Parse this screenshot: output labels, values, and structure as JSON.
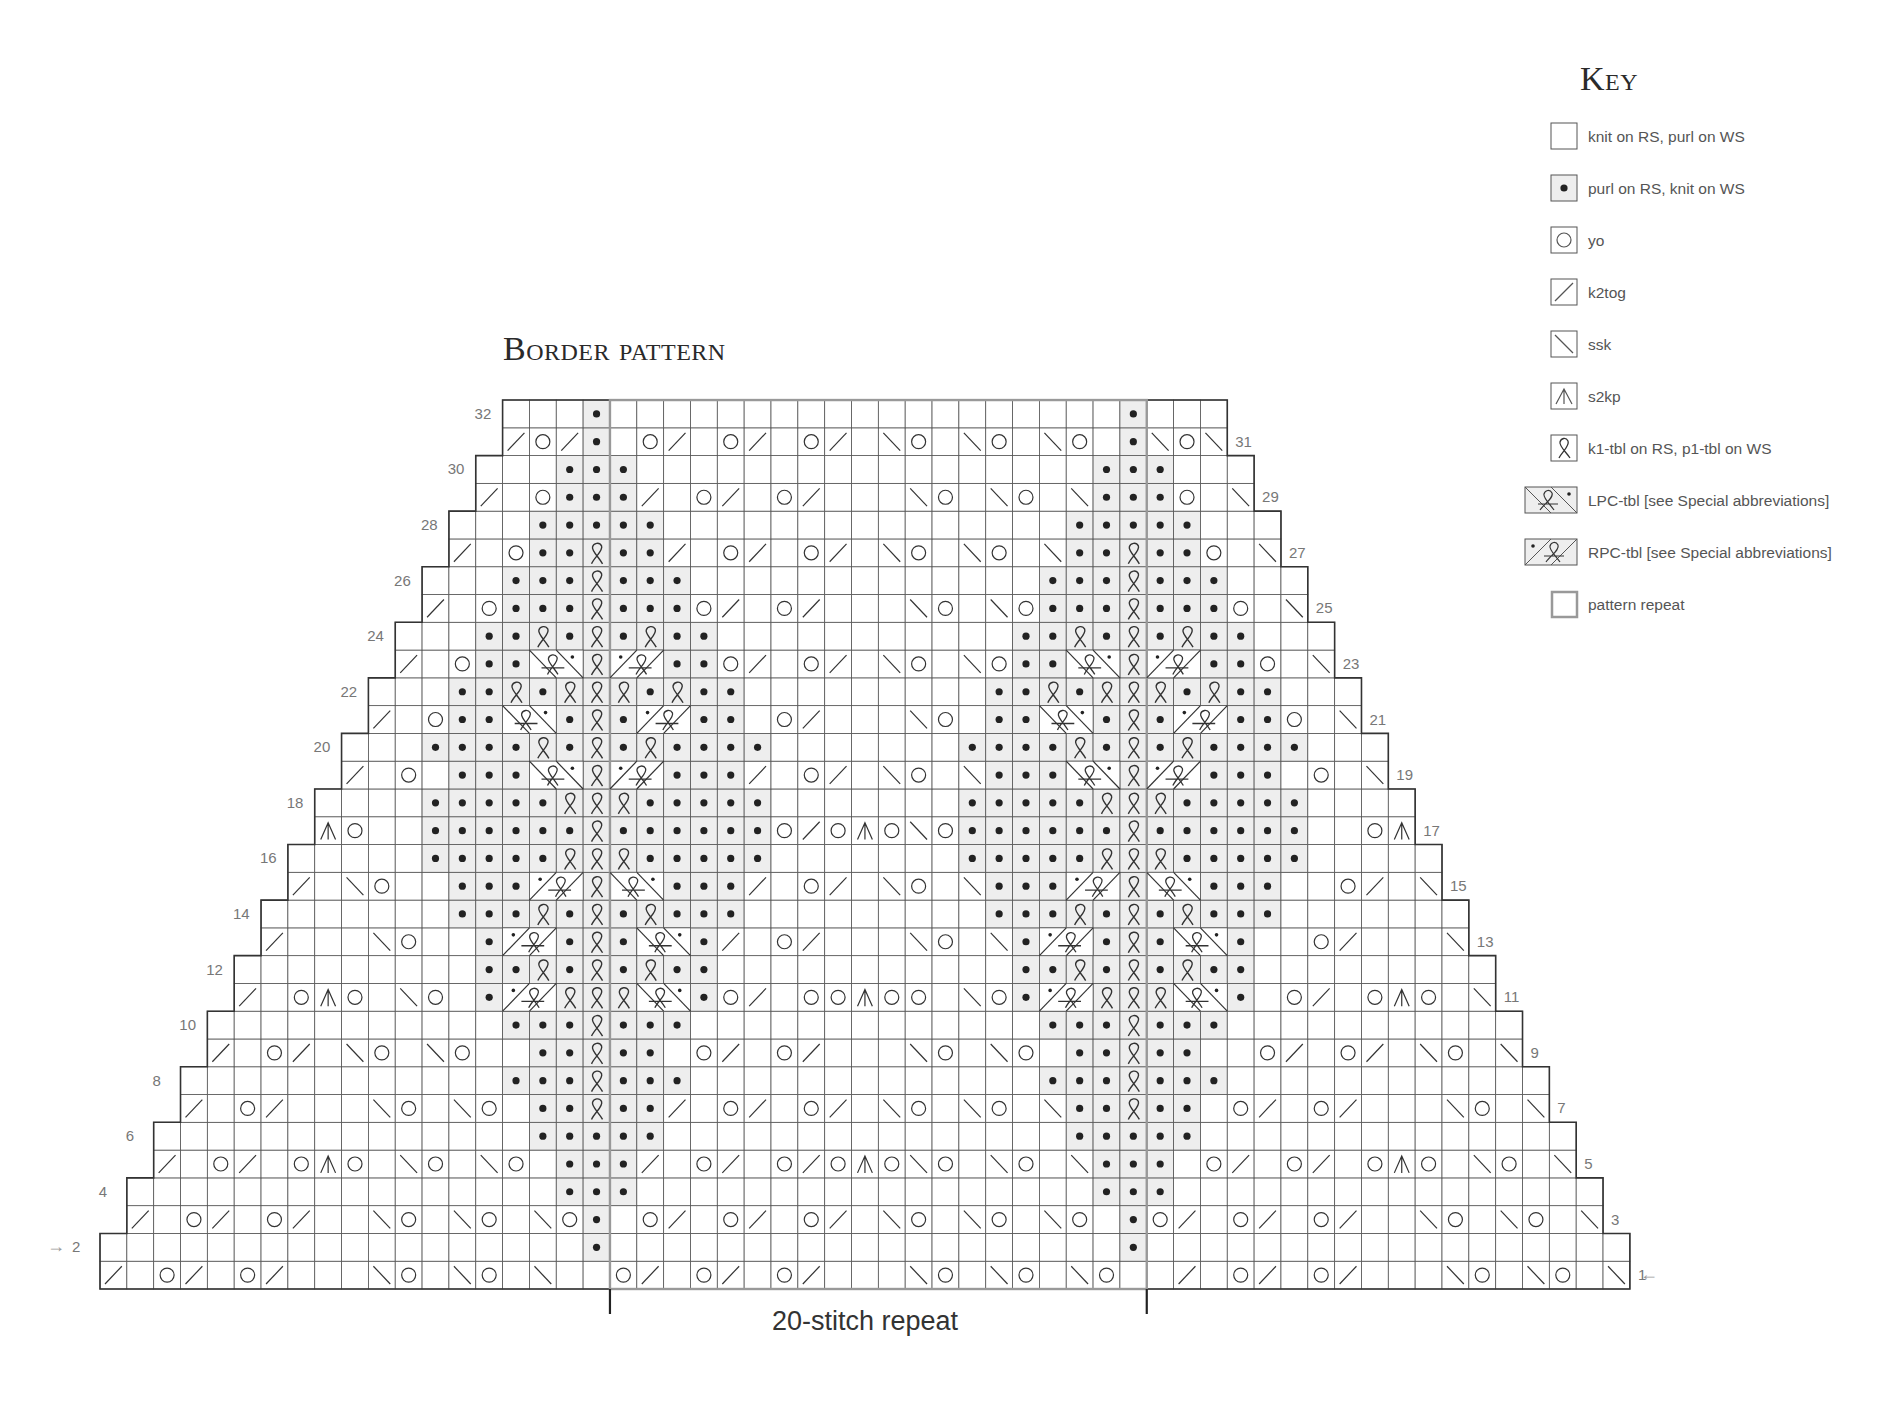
{
  "chart": {
    "title": "Border pattern",
    "repeat_label": "20-stitch repeat",
    "columns": 57,
    "rows": 32,
    "repeat_start_col": 19,
    "repeat_end_col": 38,
    "motif_centers": [
      18,
      38
    ],
    "row_1_direction": "right-to-left (RS)",
    "row_2_direction": "left-to-right (WS)",
    "start_arrows": {
      "row_1": "←",
      "row_2": "→"
    },
    "row_labels_left": [
      "2",
      "4",
      "6",
      "8",
      "10",
      "12",
      "14",
      "16",
      "18",
      "20",
      "22",
      "24",
      "26",
      "28",
      "30",
      "32"
    ],
    "row_labels_right": [
      "1",
      "3",
      "5",
      "7",
      "9",
      "11",
      "13",
      "15",
      "17",
      "19",
      "21",
      "23",
      "25",
      "27",
      "29",
      "31"
    ],
    "colors": {
      "grid": "#555555",
      "shade": "#eeeeee",
      "repeat_outline": "#999999",
      "symbol": "#333333"
    }
  },
  "key": {
    "title": "Key",
    "items": [
      {
        "symbol": "knit",
        "label": "knit on RS, purl on WS"
      },
      {
        "symbol": "purl",
        "label": "purl on RS, knit on WS"
      },
      {
        "symbol": "yo",
        "label": "yo"
      },
      {
        "symbol": "k2tog",
        "label": "k2tog"
      },
      {
        "symbol": "ssk",
        "label": "ssk"
      },
      {
        "symbol": "s2kp",
        "label": "s2kp"
      },
      {
        "symbol": "k1-tbl",
        "label": "k1-tbl on RS, p1-tbl on WS"
      },
      {
        "symbol": "lpc-tbl",
        "label": "LPC-tbl [see Special abbreviations]"
      },
      {
        "symbol": "rpc-tbl",
        "label": "RPC-tbl [see Special abbreviations]"
      },
      {
        "symbol": "pattern-repeat",
        "label": "pattern repeat"
      }
    ]
  }
}
